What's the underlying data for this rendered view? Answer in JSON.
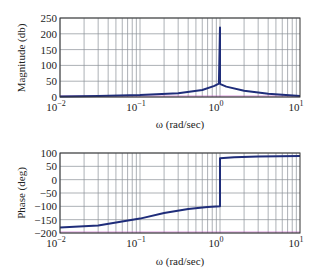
{
  "chart_data": [
    {
      "type": "line",
      "title": "",
      "xlabel": "ω (rad/sec)",
      "ylabel": "Magnitude (db)",
      "xscale": "log",
      "xlim": [
        0.01,
        10
      ],
      "ylim": [
        0,
        250
      ],
      "yticks": [
        0,
        50,
        100,
        150,
        200,
        250
      ],
      "xticks": [
        "10^-2",
        "10^-1",
        "10^0",
        "10^1"
      ],
      "grid": true,
      "series": [
        {
          "name": "magnitude",
          "color": "#1f2d7a",
          "x": [
            0.01,
            0.03,
            0.1,
            0.3,
            0.6,
            0.85,
            0.97,
            1.0,
            1.0,
            1.03,
            1.2,
            2,
            4,
            10
          ],
          "y": [
            2,
            3,
            6,
            12,
            22,
            35,
            42,
            220,
            42,
            40,
            33,
            20,
            10,
            3
          ]
        }
      ]
    },
    {
      "type": "line",
      "title": "",
      "xlabel": "ω (rad/sec)",
      "ylabel": "Phase (deg)",
      "xscale": "log",
      "xlim": [
        0.01,
        10
      ],
      "ylim": [
        -200,
        100
      ],
      "yticks": [
        -200,
        -150,
        -100,
        -50,
        0,
        50,
        100
      ],
      "xticks": [
        "10^-2",
        "10^-1",
        "10^0",
        "10^1"
      ],
      "grid": true,
      "series": [
        {
          "name": "phase",
          "color": "#1f2d7a",
          "x": [
            0.01,
            0.03,
            0.1,
            0.2,
            0.4,
            0.7,
            1.0,
            1.0,
            1.5,
            3,
            10
          ],
          "y": [
            -179,
            -172,
            -146,
            -125,
            -110,
            -103,
            -100,
            80,
            84,
            87,
            89
          ]
        }
      ]
    }
  ],
  "labels": {
    "mag_ylabel": "Magnitude (db)",
    "phase_ylabel": "Phase (deg)",
    "xlabel": "ω (rad/sec)",
    "mag_yticks": [
      "250",
      "200",
      "150",
      "100",
      "50",
      "0"
    ],
    "phase_yticks": [
      "100",
      "50",
      "0",
      "−50",
      "−100",
      "−150",
      "−200"
    ],
    "xtick_base": "10",
    "xtick_exps": [
      "−2",
      "−1",
      "0",
      "1"
    ]
  }
}
